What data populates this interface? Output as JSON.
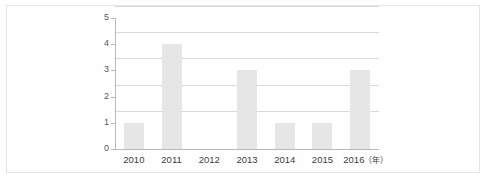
{
  "chart_data": {
    "type": "bar",
    "title": "",
    "subtitle": "",
    "xlabel": "",
    "ylabel": "",
    "x_unit_label": "（年）",
    "categories": [
      "2010",
      "2011",
      "2012",
      "2013",
      "2014",
      "2015",
      "2016"
    ],
    "values": [
      1,
      4,
      0,
      3,
      1,
      1,
      3
    ],
    "series": [
      {
        "name": "",
        "values": [
          1,
          4,
          0,
          3,
          1,
          1,
          3
        ]
      }
    ],
    "ylim": [
      0,
      5
    ],
    "y_ticks": [
      "0",
      "1",
      "2",
      "3",
      "4",
      "5"
    ],
    "grid": true,
    "grid_axis": "y",
    "legend": false,
    "legend_position": "none",
    "annotations": [],
    "colors": {
      "bar_fill": "#e6e6e6",
      "gridline": "#d9d9d9",
      "axis_line": "#b8b8b8",
      "tick_label": "#3a3a3a",
      "y_tick_label": "#555555",
      "frame_border": "#e4e4e4",
      "background": "#ffffff"
    }
  }
}
